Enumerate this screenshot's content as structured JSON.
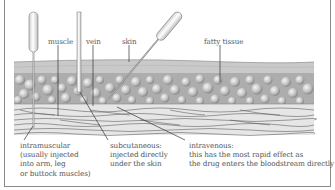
{
  "diagram": {
    "tissue_labels": {
      "muscle": "muscle",
      "vein": "vein",
      "skin": "skin",
      "fatty_tissue": "fatty tissue"
    },
    "captions": {
      "intramuscular": [
        "intramuscular",
        "(usually injected",
        "into arm, leg",
        "or buttock muscles)"
      ],
      "subcutaneous": [
        "subcutaneous:",
        "injected directly",
        "under the skin"
      ],
      "intravenous": [
        "intravenous:",
        "this has the most rapid effect as",
        "the drug enters the bloodstream directly"
      ]
    },
    "colors": {
      "border": "#8a8a8a",
      "skin_layer": "#c8c8c8",
      "fat_layer": "#b0b0b0",
      "muscle_layer": "#e4e4e4",
      "text": "#555555",
      "lines": "#333333"
    }
  }
}
